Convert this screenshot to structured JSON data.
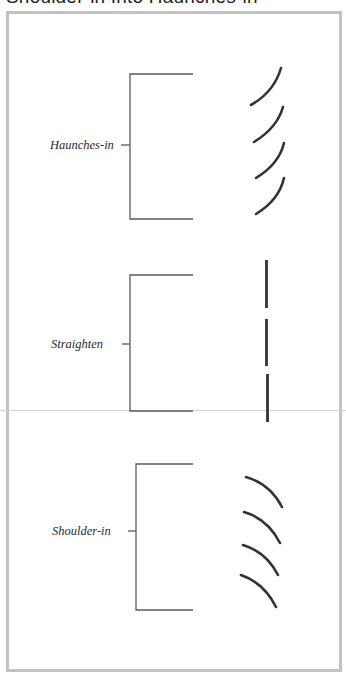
{
  "title": "Shoulder-in Into Haunches-in",
  "colors": {
    "frame_border": "#c2c2c2",
    "bracket": "#555555",
    "track_marks": "#333333",
    "label_text": "#2a2a2a"
  },
  "sections": [
    {
      "label": "Haunches-in",
      "mark_type": "arc-curving-up-right",
      "mark_count": 4
    },
    {
      "label": "Straighten",
      "mark_type": "straight-vertical",
      "mark_count": 3
    },
    {
      "label": "Shoulder-in",
      "mark_type": "arc-curving-down-right",
      "mark_count": 4
    }
  ]
}
